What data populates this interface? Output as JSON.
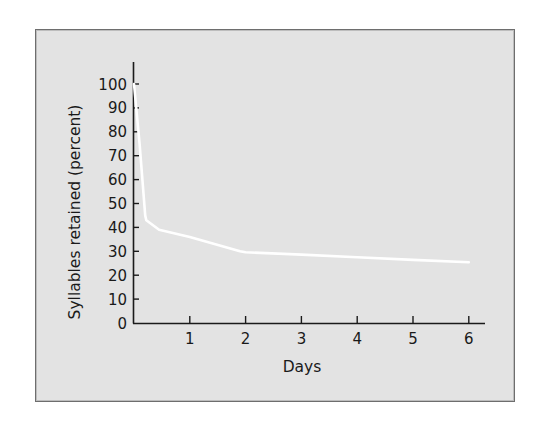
{
  "chart_data": {
    "type": "line",
    "title": "",
    "xlabel": "Days",
    "ylabel": "Syllables retained (percent)",
    "xlim": [
      0,
      6
    ],
    "ylim": [
      0,
      100
    ],
    "x_ticks": [
      1,
      2,
      3,
      4,
      5,
      6
    ],
    "y_ticks": [
      0,
      10,
      20,
      30,
      40,
      50,
      60,
      70,
      80,
      90,
      100
    ],
    "grid": false,
    "legend": null,
    "series": [
      {
        "name": "Retention",
        "color": "#ffffff",
        "x": [
          0,
          0.04,
          0.1,
          0.15,
          0.2,
          0.22,
          0.45,
          1,
          1.9,
          2,
          3,
          4,
          5,
          6
        ],
        "y": [
          100,
          90,
          75,
          60,
          45,
          43,
          39,
          36,
          30,
          29.6,
          28.6,
          27.5,
          26.4,
          25.4
        ]
      }
    ]
  },
  "colors": {
    "panel_background": "#e3e3e3",
    "panel_border": "#6e6e6e",
    "axis": "#1a1a1a",
    "line": "#ffffff"
  }
}
